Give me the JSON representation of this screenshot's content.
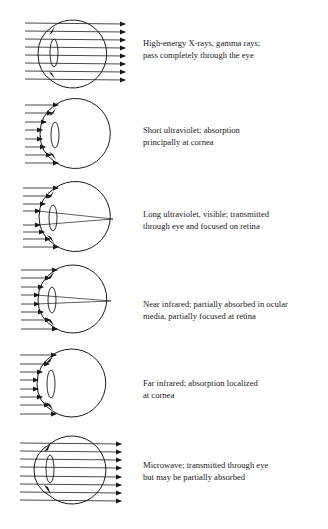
{
  "diagram": {
    "panels": [
      {
        "id": "xray-gamma",
        "type": "pass-through",
        "caption_line1": "High-energy X-rays, gamma rays;",
        "caption_line2": "pass completely through the eye"
      },
      {
        "id": "short-uv",
        "type": "absorbed-at-cornea",
        "caption_line1": "Short ultraviolet;  absorption",
        "caption_line2": "principally at cornea"
      },
      {
        "id": "long-uv-visible",
        "type": "focused-on-retina",
        "caption_line1": "Long ultraviolet, visible; transmitted",
        "caption_line2": "through eye and focused on retina"
      },
      {
        "id": "near-infrared",
        "type": "focused-on-retina",
        "caption_line1": "Near infrared; partially absorbed in ocular",
        "caption_line2": "media, partially focused at retina"
      },
      {
        "id": "far-infrared",
        "type": "absorbed-at-cornea",
        "caption_line1": "Far infrared; absorption localized",
        "caption_line2": "at cornea"
      },
      {
        "id": "microwave",
        "type": "pass-through",
        "caption_line1": "Microwave; transmitted through eye",
        "caption_line2": "but may be partially absorbed"
      }
    ],
    "colors": {
      "line": "#1a1a1a",
      "background": "#ffffff"
    }
  }
}
